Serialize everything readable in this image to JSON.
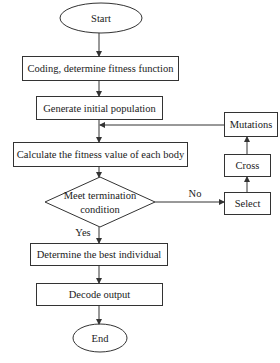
{
  "diagram": {
    "type": "flowchart",
    "nodes": {
      "start": "Start",
      "coding": "Coding, determine fitness function",
      "generate": "Generate initial population",
      "calculate": "Calculate the fitness value of each body",
      "decision_line1": "Meet termination",
      "decision_line2": "condition",
      "determine": "Determine the best individual",
      "decode": "Decode output",
      "end": "End",
      "select": "Select",
      "cross": "Cross",
      "mutations": "Mutations"
    },
    "edge_labels": {
      "no": "No",
      "yes": "Yes"
    },
    "colors": {
      "stroke": "#333333",
      "text": "#1a1a1a",
      "background": "#ffffff"
    }
  }
}
